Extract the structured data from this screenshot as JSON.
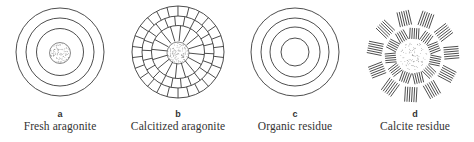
{
  "panels": [
    {
      "letter": "a",
      "caption": "Fresh aragonite",
      "style": "concentric-rings-with-core"
    },
    {
      "letter": "b",
      "caption": "Calcitized aragonite",
      "style": "concentric-rings-with-radial-segments-and-core"
    },
    {
      "letter": "c",
      "caption": "Organic residue",
      "style": "concentric-rings-no-core"
    },
    {
      "letter": "d",
      "caption": "Calcite residue",
      "style": "radial-dash-clusters-with-core"
    }
  ],
  "colors": {
    "line": "#3a3a3a",
    "core_stipple": "#8a8a8a",
    "background": "#ffffff"
  }
}
